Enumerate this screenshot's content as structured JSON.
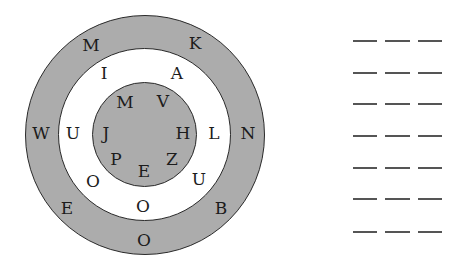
{
  "diagram": {
    "type": "concentric-letter-circles",
    "colors": {
      "outer_ring": "#acacac",
      "middle_ring": "#ffffff",
      "inner_circle": "#acacac",
      "stroke": "#2a2a2a"
    },
    "center": [
      144.5,
      134.5
    ],
    "radii": {
      "outer": 120,
      "middle": 86.5,
      "inner": 52.5
    },
    "outer_letters": [
      {
        "ch": "M",
        "x": 91,
        "y": 45
      },
      {
        "ch": "K",
        "x": 195,
        "y": 43
      },
      {
        "ch": "W",
        "x": 41,
        "y": 133
      },
      {
        "ch": "N",
        "x": 248,
        "y": 133
      },
      {
        "ch": "E",
        "x": 67,
        "y": 208
      },
      {
        "ch": "B",
        "x": 221,
        "y": 208
      },
      {
        "ch": "O",
        "x": 144,
        "y": 240
      }
    ],
    "middle_letters": [
      {
        "ch": "I",
        "x": 104,
        "y": 73
      },
      {
        "ch": "A",
        "x": 177,
        "y": 73
      },
      {
        "ch": "U",
        "x": 73,
        "y": 133
      },
      {
        "ch": "L",
        "x": 214,
        "y": 133
      },
      {
        "ch": "O",
        "x": 93,
        "y": 181
      },
      {
        "ch": "U",
        "x": 199,
        "y": 179
      },
      {
        "ch": "O",
        "x": 143,
        "y": 206
      }
    ],
    "inner_letters": [
      {
        "ch": "M",
        "x": 125,
        "y": 102
      },
      {
        "ch": "V",
        "x": 163,
        "y": 101
      },
      {
        "ch": "J",
        "x": 106,
        "y": 133
      },
      {
        "ch": "H",
        "x": 183,
        "y": 133
      },
      {
        "ch": "P",
        "x": 116,
        "y": 159
      },
      {
        "ch": "E",
        "x": 144,
        "y": 171
      },
      {
        "ch": "Z",
        "x": 172,
        "y": 159
      }
    ]
  },
  "answer_blanks": {
    "rows": 7,
    "blanks_per_row": 3,
    "row_y": [
      40,
      72,
      103,
      135,
      167,
      198,
      231
    ],
    "col_x": [
      [
        353,
        377
      ],
      [
        385,
        410
      ],
      [
        418,
        442
      ]
    ]
  }
}
